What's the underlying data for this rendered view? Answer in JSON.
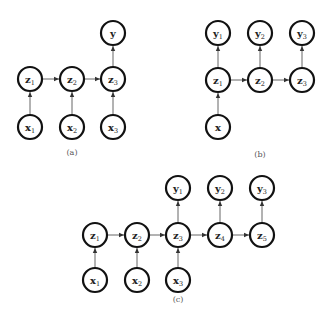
{
  "node_radius": 12,
  "colors": {
    "node_stroke": "#111111",
    "edge": "#555555",
    "label": "#222222",
    "caption": "#555555"
  },
  "diagrams": [
    {
      "id": "a",
      "caption": "(a)",
      "caption_pos": [
        72,
        155
      ],
      "nodes": [
        {
          "id": "y",
          "base": "y",
          "sub": "",
          "x": 113,
          "y": 33
        },
        {
          "id": "z1",
          "base": "z",
          "sub": "1",
          "x": 30,
          "y": 79
        },
        {
          "id": "z2",
          "base": "z",
          "sub": "2",
          "x": 72,
          "y": 79
        },
        {
          "id": "z3",
          "base": "z",
          "sub": "3",
          "x": 113,
          "y": 79
        },
        {
          "id": "x1",
          "base": "x",
          "sub": "1",
          "x": 30,
          "y": 127
        },
        {
          "id": "x2",
          "base": "x",
          "sub": "2",
          "x": 72,
          "y": 127
        },
        {
          "id": "x3",
          "base": "x",
          "sub": "3",
          "x": 113,
          "y": 127
        }
      ],
      "edges": [
        [
          "x1",
          "z1"
        ],
        [
          "x2",
          "z2"
        ],
        [
          "x3",
          "z3"
        ],
        [
          "z1",
          "z2"
        ],
        [
          "z2",
          "z3"
        ],
        [
          "z3",
          "y"
        ]
      ]
    },
    {
      "id": "b",
      "caption": "(b)",
      "caption_pos": [
        260,
        157
      ],
      "nodes": [
        {
          "id": "y1",
          "base": "y",
          "sub": "1",
          "x": 218,
          "y": 33
        },
        {
          "id": "y2",
          "base": "y",
          "sub": "2",
          "x": 260,
          "y": 33
        },
        {
          "id": "y3",
          "base": "y",
          "sub": "3",
          "x": 302,
          "y": 33
        },
        {
          "id": "z1",
          "base": "z",
          "sub": "1",
          "x": 218,
          "y": 80
        },
        {
          "id": "z2",
          "base": "z",
          "sub": "2",
          "x": 260,
          "y": 80
        },
        {
          "id": "z3",
          "base": "z",
          "sub": "3",
          "x": 302,
          "y": 80
        },
        {
          "id": "x",
          "base": "x",
          "sub": "",
          "x": 218,
          "y": 127
        }
      ],
      "edges": [
        [
          "x",
          "z1"
        ],
        [
          "z1",
          "z2"
        ],
        [
          "z2",
          "z3"
        ],
        [
          "z1",
          "y1"
        ],
        [
          "z2",
          "y2"
        ],
        [
          "z3",
          "y3"
        ]
      ]
    },
    {
      "id": "c",
      "caption": "(c)",
      "caption_pos": [
        178,
        302
      ],
      "nodes": [
        {
          "id": "y1",
          "base": "y",
          "sub": "1",
          "x": 178,
          "y": 188
        },
        {
          "id": "y2",
          "base": "y",
          "sub": "2",
          "x": 220,
          "y": 188
        },
        {
          "id": "y3",
          "base": "y",
          "sub": "3",
          "x": 262,
          "y": 188
        },
        {
          "id": "z1",
          "base": "z",
          "sub": "1",
          "x": 95,
          "y": 235
        },
        {
          "id": "z2",
          "base": "z",
          "sub": "2",
          "x": 137,
          "y": 235
        },
        {
          "id": "z3",
          "base": "z",
          "sub": "3",
          "x": 178,
          "y": 235
        },
        {
          "id": "z4",
          "base": "z",
          "sub": "4",
          "x": 220,
          "y": 235
        },
        {
          "id": "z5",
          "base": "z",
          "sub": "5",
          "x": 262,
          "y": 235
        },
        {
          "id": "x1",
          "base": "x",
          "sub": "1",
          "x": 95,
          "y": 280
        },
        {
          "id": "x2",
          "base": "x",
          "sub": "2",
          "x": 137,
          "y": 280
        },
        {
          "id": "x3",
          "base": "x",
          "sub": "3",
          "x": 178,
          "y": 280
        }
      ],
      "edges": [
        [
          "x1",
          "z1"
        ],
        [
          "x2",
          "z2"
        ],
        [
          "x3",
          "z3"
        ],
        [
          "z1",
          "z2"
        ],
        [
          "z2",
          "z3"
        ],
        [
          "z3",
          "z4"
        ],
        [
          "z4",
          "z5"
        ],
        [
          "z3",
          "y1"
        ],
        [
          "z4",
          "y2"
        ],
        [
          "z5",
          "y3"
        ]
      ]
    }
  ]
}
